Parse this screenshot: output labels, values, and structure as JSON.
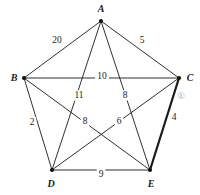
{
  "figure": {
    "name": "weighted-complete-graph-k5",
    "background": "#ffffff",
    "edge_color": "#1a1a1a",
    "vertex_color": "#111111",
    "annotation_color": "#a9a9a9"
  },
  "vertices": [
    {
      "id": "A",
      "label": "A",
      "x": 101,
      "y": 21,
      "label_x": 101,
      "label_y": 12
    },
    {
      "id": "B",
      "label": "B",
      "x": 24,
      "y": 78,
      "label_x": 14,
      "label_y": 81
    },
    {
      "id": "C",
      "label": "C",
      "x": 179,
      "y": 78,
      "label_x": 190,
      "label_y": 81
    },
    {
      "id": "D",
      "label": "D",
      "x": 52,
      "y": 170,
      "label_x": 51,
      "label_y": 187
    },
    {
      "id": "E",
      "label": "E",
      "x": 150,
      "y": 170,
      "label_x": 151,
      "label_y": 187
    }
  ],
  "edges": [
    {
      "from": "A",
      "to": "B",
      "weight": "20",
      "highlighted": false,
      "label_x": 57,
      "label_y": 43
    },
    {
      "from": "A",
      "to": "C",
      "weight": "5",
      "highlighted": false,
      "label_x": 142,
      "label_y": 43
    },
    {
      "from": "B",
      "to": "C",
      "weight": "10",
      "highlighted": false,
      "label_x": 102,
      "label_y": 79
    },
    {
      "from": "A",
      "to": "D",
      "weight": "11",
      "highlighted": false,
      "label_x": 79,
      "label_y": 98
    },
    {
      "from": "A",
      "to": "E",
      "weight": "8",
      "highlighted": false,
      "label_x": 125,
      "label_y": 98
    },
    {
      "from": "B",
      "to": "D",
      "weight": "2",
      "highlighted": false,
      "label_x": 32,
      "label_y": 125
    },
    {
      "from": "B",
      "to": "E",
      "weight": "8",
      "highlighted": false,
      "label_x": 85,
      "label_y": 124
    },
    {
      "from": "C",
      "to": "D",
      "weight": "6",
      "highlighted": false,
      "label_x": 119,
      "label_y": 124
    },
    {
      "from": "C",
      "to": "E",
      "weight": "4",
      "highlighted": true,
      "label_x": 174,
      "label_y": 120
    },
    {
      "from": "D",
      "to": "E",
      "weight": "9",
      "highlighted": false,
      "label_x": 101,
      "label_y": 177
    }
  ],
  "annotations": [
    {
      "id": "circled-one",
      "text": "①",
      "x": 181,
      "y": 99
    }
  ]
}
